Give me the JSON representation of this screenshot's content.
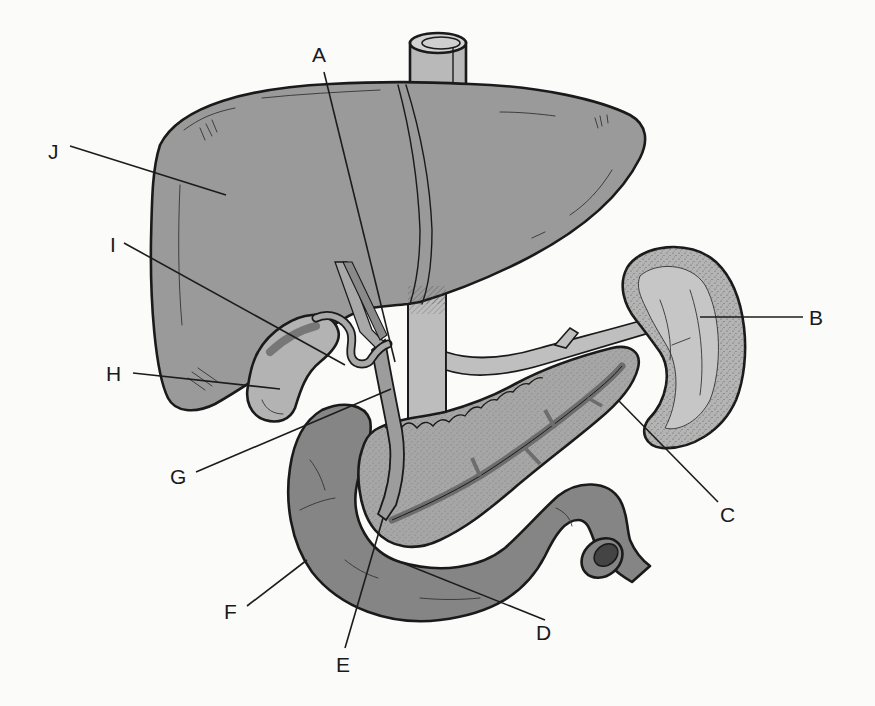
{
  "diagram": {
    "colors": {
      "background": "#fbfbfa",
      "liver": "#9a9a9a",
      "duodenum": "#858585",
      "pancreas": "#a6a6a6",
      "spleen_rim": "#b4b4b4",
      "spleen_inner": "#c2c2c2",
      "gallbladder": "#b3b3b3",
      "vessels": "#bdbdbd",
      "outline": "#1a1a1a"
    },
    "structures": [
      {
        "name": "liver",
        "label": "J"
      },
      {
        "name": "inferior-vena-cava",
        "label": null
      },
      {
        "name": "gallbladder",
        "label": "H"
      },
      {
        "name": "cystic-duct",
        "label": "I"
      },
      {
        "name": "hepatic-duct",
        "label": "A"
      },
      {
        "name": "common-bile-duct",
        "label": "G"
      },
      {
        "name": "spleen",
        "label": "B"
      },
      {
        "name": "pancreas-tail",
        "label": "C"
      },
      {
        "name": "pancreatic-duct",
        "label": "D"
      },
      {
        "name": "duct-ampulla",
        "label": "E"
      },
      {
        "name": "duodenum",
        "label": "F"
      }
    ],
    "labels": [
      {
        "id": "A",
        "text": "A",
        "x": 322,
        "y": 60,
        "line": [
          [
            324,
            72
          ],
          [
            395,
            362
          ]
        ]
      },
      {
        "id": "B",
        "text": "B",
        "x": 812,
        "y": 324,
        "line": [
          [
            803,
            317
          ],
          [
            700,
            317
          ]
        ]
      },
      {
        "id": "C",
        "text": "C",
        "x": 724,
        "y": 520,
        "line": [
          [
            718,
            502
          ],
          [
            618,
            400
          ]
        ]
      },
      {
        "id": "D",
        "text": "D",
        "x": 538,
        "y": 638,
        "line": [
          [
            545,
            620
          ],
          [
            395,
            560
          ]
        ]
      },
      {
        "id": "E",
        "text": "E",
        "x": 338,
        "y": 668,
        "line": [
          [
            345,
            648
          ],
          [
            383,
            518
          ]
        ]
      },
      {
        "id": "F",
        "text": "F",
        "x": 226,
        "y": 614,
        "line": [
          [
            247,
            606
          ],
          [
            307,
            560
          ]
        ]
      },
      {
        "id": "G",
        "text": "G",
        "x": 172,
        "y": 481,
        "line": [
          [
            196,
            472
          ],
          [
            391,
            389
          ]
        ]
      },
      {
        "id": "H",
        "text": "H",
        "x": 108,
        "y": 382,
        "line": [
          [
            133,
            373
          ],
          [
            280,
            389
          ]
        ]
      },
      {
        "id": "I",
        "text": "I",
        "x": 111,
        "y": 253,
        "line": [
          [
            124,
            243
          ],
          [
            345,
            365
          ]
        ]
      },
      {
        "id": "J",
        "text": "J",
        "x": 50,
        "y": 157,
        "line": [
          [
            70,
            146
          ],
          [
            226,
            195
          ]
        ]
      }
    ]
  }
}
